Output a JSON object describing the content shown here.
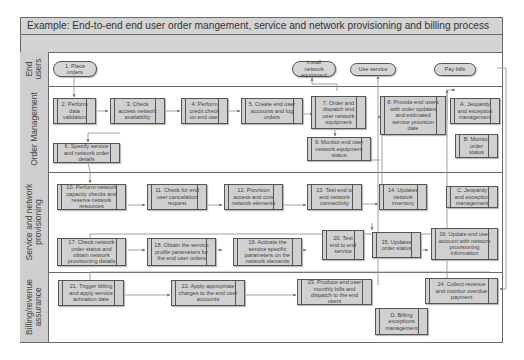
{
  "title": "Example: End-to-end end user order mangement, service and network provisioning and billing process",
  "lanes": [
    {
      "label": "End users"
    },
    {
      "label": "Order Management"
    },
    {
      "label": "Service and network provisioning"
    },
    {
      "label": "Billing/revenue assurance"
    }
  ],
  "terminals": [
    {
      "id": "t1",
      "label": "1. Place orders"
    },
    {
      "id": "t2",
      "label": "Install network equipment"
    },
    {
      "id": "t3",
      "label": "Use service"
    },
    {
      "id": "t4",
      "label": "Pay bills"
    }
  ],
  "steps": [
    {
      "id": "s2",
      "label": "2. Perform data validation"
    },
    {
      "id": "s3",
      "label": "3. Check access network availability"
    },
    {
      "id": "s4",
      "label": "4. Perform credit check on end user"
    },
    {
      "id": "s5",
      "label": "5. Create end user accounts and log orders"
    },
    {
      "id": "s6",
      "label": "6. Specify service and network order details"
    },
    {
      "id": "s7",
      "label": "7. Order and dispatch end user network equipment"
    },
    {
      "id": "s8",
      "label": "8. Provide end users with order updates and estimated service provision date"
    },
    {
      "id": "s9",
      "label": "9. Monitor end user network equipment status"
    },
    {
      "id": "sA",
      "label": "A. Jeopardy and exception management"
    },
    {
      "id": "sB",
      "label": "B. Monitor order status"
    },
    {
      "id": "s10",
      "label": "10. Perform network capacity checks and reserve network resources"
    },
    {
      "id": "s11",
      "label": "11. Check for end user cancelation request"
    },
    {
      "id": "s12",
      "label": "12. Provision access and core network elements"
    },
    {
      "id": "s13",
      "label": "13. Test end to end network connectivity"
    },
    {
      "id": "s14",
      "label": "14. Updates network inventory"
    },
    {
      "id": "sC",
      "label": "C. Jeopardy and exception management"
    },
    {
      "id": "s17",
      "label": "17. Check network order status and obtain network provisioning details"
    },
    {
      "id": "s18",
      "label": "18. Obtain the service profile parameters for the end user orders"
    },
    {
      "id": "s19",
      "label": "19. Activate the service specific parameters on the network elements"
    },
    {
      "id": "s20",
      "label": "20. Test end to end service"
    },
    {
      "id": "s15",
      "label": "15. Updates order status"
    },
    {
      "id": "s16",
      "label": "16. Update end user account with network provisioning information"
    },
    {
      "id": "s21",
      "label": "21. Trigger billing and apply service activation date"
    },
    {
      "id": "s22",
      "label": "22. Apply appropriate charges to the end user accounts"
    },
    {
      "id": "s23",
      "label": "23. Produce end user monthly bills and dispatch to the end users"
    },
    {
      "id": "s24",
      "label": "24. Collect revenue and monitor overdue payment"
    },
    {
      "id": "sD",
      "label": "D. Billing exceptions management"
    }
  ],
  "colors": {
    "box_fill": "#d0d0d0",
    "lane_label_fill": "#cfcfcf",
    "header_fill": "#d4d4d4",
    "border": "#555555",
    "connector": "#888888"
  }
}
